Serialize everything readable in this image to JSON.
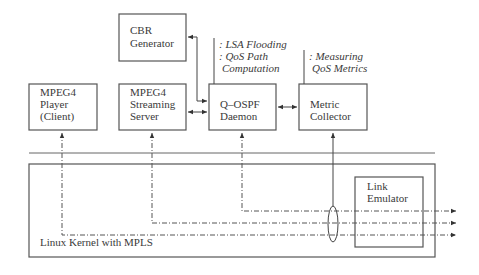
{
  "diagram": {
    "nodes": {
      "cbr": {
        "lines": [
          "CBR",
          "Generator"
        ]
      },
      "player": {
        "lines": [
          "MPEG4",
          "Player",
          "(Client)"
        ]
      },
      "server": {
        "lines": [
          "MPEG4",
          "Streaming",
          "Server"
        ]
      },
      "daemon": {
        "lines": [
          "Q–OSPF",
          "Daemon"
        ]
      },
      "collector": {
        "lines": [
          "Metric",
          "Collector"
        ]
      },
      "emulator": {
        "lines": [
          "Link",
          "Emulator"
        ]
      }
    },
    "annotations": {
      "daemon": [
        ": LSA Flooding",
        ": QoS Path",
        "  Computation"
      ],
      "collector": [
        ": Measuring",
        "  QoS Metrics"
      ]
    },
    "kernel_label": "Linux Kernel with MPLS",
    "edges": [
      {
        "from": "cbr",
        "to": "daemon",
        "style": "solid",
        "direction": "both"
      },
      {
        "from": "server",
        "to": "daemon",
        "style": "solid",
        "direction": "both"
      },
      {
        "from": "daemon",
        "to": "collector",
        "style": "solid",
        "direction": "both"
      },
      {
        "from": "player",
        "to": "kernel-out",
        "style": "dash-dot",
        "direction": "both"
      },
      {
        "from": "server",
        "to": "kernel-out",
        "style": "dash-dot",
        "direction": "both"
      },
      {
        "from": "daemon",
        "to": "kernel-out",
        "style": "dash-dot",
        "direction": "both"
      },
      {
        "from": "collector",
        "to": "traffic-bundle",
        "style": "solid",
        "direction": "to-collector"
      }
    ]
  }
}
